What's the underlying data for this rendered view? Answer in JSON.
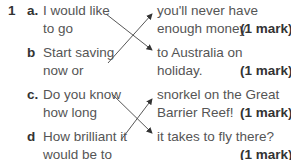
{
  "question": {
    "number": "1",
    "items": [
      {
        "letter": "a.",
        "left_line1": "I would like",
        "left_line2": "to go"
      },
      {
        "letter": "b",
        "left_line1": "Start saving",
        "left_line2": "now or"
      },
      {
        "letter": "c.",
        "left_line1": "Do you know",
        "left_line2": "how long"
      },
      {
        "letter": "d",
        "left_line1": "How brilliant it",
        "left_line2": "would be to"
      }
    ],
    "answers": [
      {
        "line1": "you'll never have",
        "line2": "enough money.",
        "mark": "(1 mark)"
      },
      {
        "line1": "to Australia on",
        "line2": "holiday.",
        "mark": "(1 mark)"
      },
      {
        "line1": "snorkel on the Great",
        "line2": "Barrier Reef!",
        "mark": "(1 mark)"
      },
      {
        "line1": "it takes to fly there?",
        "line2": "",
        "mark": "(1 mark)"
      }
    ]
  }
}
